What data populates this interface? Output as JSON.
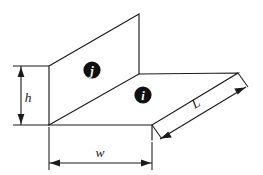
{
  "figure": {
    "background_color": "#ffffff",
    "line_color": "#1a1a1a",
    "node_fill_color": "#111111",
    "node_text_color": "#ffffff"
  },
  "dimensions": [
    {
      "key": "h",
      "label": "h",
      "orientation": "vertical",
      "position": "left"
    },
    {
      "key": "w",
      "label": "w",
      "orientation": "horizontal",
      "position": "bottom"
    },
    {
      "key": "L",
      "label": "L",
      "orientation": "diagonal",
      "position": "right"
    }
  ],
  "labels": {
    "height": "h",
    "width": "w",
    "length": "L"
  },
  "nodes": [
    {
      "key": "j",
      "label": "j",
      "face": "vertical-web"
    },
    {
      "key": "i",
      "label": "i",
      "face": "horizontal-flange"
    }
  ],
  "node_labels": {
    "j": "j",
    "i": "i"
  }
}
